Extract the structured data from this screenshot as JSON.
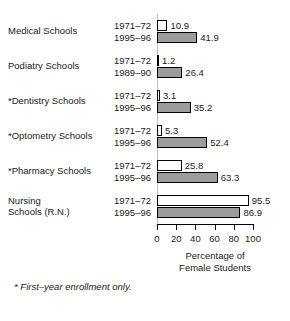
{
  "chart_data": {
    "type": "bar",
    "orientation": "horizontal",
    "title": "",
    "xlabel_lines": [
      "Percentage of",
      "Female Students"
    ],
    "ylabel": "",
    "xlim": [
      0,
      100
    ],
    "xticks": [
      0,
      20,
      40,
      60,
      80,
      100
    ],
    "xtick_labels": [
      "0",
      "20",
      "40",
      "60",
      "80",
      "100"
    ],
    "grid": false,
    "legend": "none",
    "footnote": "* First–year enrollment only.",
    "categories": [
      "Medical Schools",
      "Podiatry Schools",
      "*Dentistry Schools",
      "*Optometry Schools",
      "*Pharmacy Schools",
      "Nursing\nSchools (R.N.)"
    ],
    "groups": [
      {
        "category": "Medical Schools",
        "bars": [
          {
            "period": "1971–72",
            "value": 10.9,
            "value_label": "10.9",
            "style": "white"
          },
          {
            "period": "1995–96",
            "value": 41.9,
            "value_label": "41.9",
            "style": "gray"
          }
        ]
      },
      {
        "category": "Podiatry Schools",
        "bars": [
          {
            "period": "1971–72",
            "value": 1.2,
            "value_label": "1.2",
            "style": "white"
          },
          {
            "period": "1989–90",
            "value": 26.4,
            "value_label": "26.4",
            "style": "gray"
          }
        ]
      },
      {
        "category": "*Dentistry Schools",
        "bars": [
          {
            "period": "1971–72",
            "value": 3.1,
            "value_label": "3.1",
            "style": "white"
          },
          {
            "period": "1995–96",
            "value": 35.2,
            "value_label": "35.2",
            "style": "gray"
          }
        ]
      },
      {
        "category": "*Optometry Schools",
        "bars": [
          {
            "period": "1971–72",
            "value": 5.3,
            "value_label": "5.3",
            "style": "white"
          },
          {
            "period": "1995–96",
            "value": 52.4,
            "value_label": "52.4",
            "style": "gray"
          }
        ]
      },
      {
        "category": "*Pharmacy Schools",
        "bars": [
          {
            "period": "1971–72",
            "value": 25.8,
            "value_label": "25.8",
            "style": "white"
          },
          {
            "period": "1995–96",
            "value": 63.3,
            "value_label": "63.3",
            "style": "gray"
          }
        ]
      },
      {
        "category": "Nursing\nSchools (R.N.)",
        "bars": [
          {
            "period": "1971–72",
            "value": 95.5,
            "value_label": "95.5",
            "style": "white"
          },
          {
            "period": "1995–96",
            "value": 86.9,
            "value_label": "86.9",
            "style": "gray"
          }
        ]
      }
    ],
    "series": [
      {
        "name": "earlier period",
        "style": "white",
        "values": [
          10.9,
          1.2,
          3.1,
          5.3,
          25.8,
          95.5
        ]
      },
      {
        "name": "later period",
        "style": "gray",
        "values": [
          41.9,
          26.4,
          35.2,
          52.4,
          63.3,
          86.9
        ]
      }
    ],
    "colors": {
      "bar_white": "#ffffff",
      "bar_gray": "#9c9c9c",
      "outline": "#000000",
      "text": "#1a1a1a",
      "background": "#ffffff"
    }
  }
}
